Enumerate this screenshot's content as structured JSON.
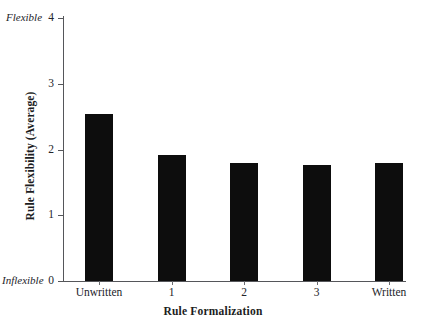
{
  "chart_data": {
    "type": "bar",
    "title": "",
    "categories": [
      "Unwritten",
      "1",
      "2",
      "3",
      "Written"
    ],
    "values": [
      2.54,
      1.92,
      1.8,
      1.76,
      1.8
    ],
    "series": [
      {
        "name": "Rule Flexibility (Average)",
        "values": [
          2.54,
          1.92,
          1.8,
          1.76,
          1.8
        ]
      }
    ],
    "xlabel": "Rule Formalization",
    "ylabel": "Rule Flexibility (Average)",
    "ylim": [
      0,
      4
    ],
    "yticks": [
      0,
      1,
      2,
      3,
      4
    ],
    "ytick_labels": [
      "0",
      "1",
      "2",
      "3",
      "4"
    ],
    "y_axis_end_labels": {
      "top": "Flexible",
      "bottom": "Inflexible"
    },
    "grid": false,
    "legend": null,
    "bar_color": "#0d0d0d",
    "axis_color": "#55565a",
    "background": "#ffffff"
  },
  "axes": {
    "x_title": "Rule Formalization",
    "y_title": "Rule Flexibility (Average)"
  },
  "labels": {
    "flexible": "Flexible",
    "inflexible": "Inflexible"
  },
  "yticks": [
    {
      "value": 4,
      "label": "4"
    },
    {
      "value": 3,
      "label": "3"
    },
    {
      "value": 2,
      "label": "2"
    },
    {
      "value": 1,
      "label": "1"
    },
    {
      "value": 0,
      "label": "0"
    }
  ],
  "bars": [
    {
      "category": "Unwritten",
      "value": 2.54
    },
    {
      "category": "1",
      "value": 1.92
    },
    {
      "category": "2",
      "value": 1.8
    },
    {
      "category": "3",
      "value": 1.76
    },
    {
      "category": "Written",
      "value": 1.8
    }
  ]
}
